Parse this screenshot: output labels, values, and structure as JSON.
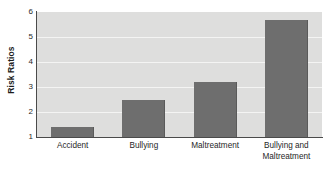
{
  "chart_data": {
    "type": "bar",
    "title": "",
    "xlabel": "",
    "ylabel": "Risk Ratios",
    "categories": [
      "Accident",
      "Bullying",
      "Maltreatment",
      "Bullying and Maltreatment"
    ],
    "category_lines": [
      [
        "Accident"
      ],
      [
        "Bullying"
      ],
      [
        "Maltreatment"
      ],
      [
        "Bullying and",
        "Maltreatment"
      ]
    ],
    "values": [
      1.4,
      2.5,
      3.2,
      5.7
    ],
    "ylim": [
      1,
      6
    ],
    "yticks": [
      1,
      2,
      3,
      4,
      5,
      6
    ],
    "ytick_labels": [
      "1",
      "2",
      "3",
      "4",
      "5",
      "6"
    ],
    "grid": true,
    "legend": false,
    "colors": {
      "bar": "#6e6e6e",
      "plot_background": "#dededd",
      "gridline": "#f4f4f3",
      "axis": "#4a4a4a",
      "text": "#1f1f1f",
      "figure_background": "#ffffff"
    }
  }
}
